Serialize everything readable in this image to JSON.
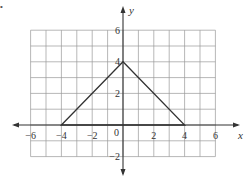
{
  "figure": {
    "marker": "•",
    "axes": {
      "x_label": "x",
      "y_label": "y",
      "x_ticks": [
        {
          "value": -6,
          "label": "−6"
        },
        {
          "value": -4,
          "label": "−4"
        },
        {
          "value": -2,
          "label": "−2"
        },
        {
          "value": 2,
          "label": "2"
        },
        {
          "value": 4,
          "label": "4"
        },
        {
          "value": 6,
          "label": "6"
        }
      ],
      "y_ticks": [
        {
          "value": 6,
          "label": "6"
        },
        {
          "value": 4,
          "label": "4"
        },
        {
          "value": 2,
          "label": "2"
        },
        {
          "value": -2,
          "label": "−2"
        }
      ],
      "origin_label": "0"
    },
    "grid": {
      "x_range": [
        -6,
        6
      ],
      "y_range": [
        -2,
        6
      ],
      "step": 1
    },
    "shape": {
      "type": "triangle",
      "vertices": [
        [
          -4,
          0
        ],
        [
          0,
          4
        ],
        [
          4,
          0
        ]
      ]
    },
    "colors": {
      "grid": "#9a9a9a",
      "axis": "#333333",
      "shape": "#333333"
    }
  }
}
